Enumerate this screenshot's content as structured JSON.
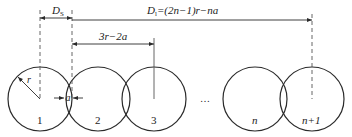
{
  "diagram": {
    "title": "",
    "colors": {
      "stroke": "#2a2a2a",
      "dashed": "#555555",
      "text": "#222222"
    },
    "circles": [
      {
        "id": "1",
        "label": "1"
      },
      {
        "id": "2",
        "label": "2"
      },
      {
        "id": "3",
        "label": "3"
      },
      {
        "id": "n",
        "label": "n"
      },
      {
        "id": "n+1",
        "label": "n+1"
      }
    ],
    "ellipsis": "…",
    "dimensions": {
      "ds": {
        "main": "D",
        "sub": "S"
      },
      "dl": {
        "main": "D",
        "sub": "l",
        "expr": "=(2n−1)r−na"
      },
      "pitch": {
        "label": "3r−2a"
      },
      "overlap": {
        "label": "a"
      },
      "radius": {
        "label": "r"
      }
    }
  }
}
